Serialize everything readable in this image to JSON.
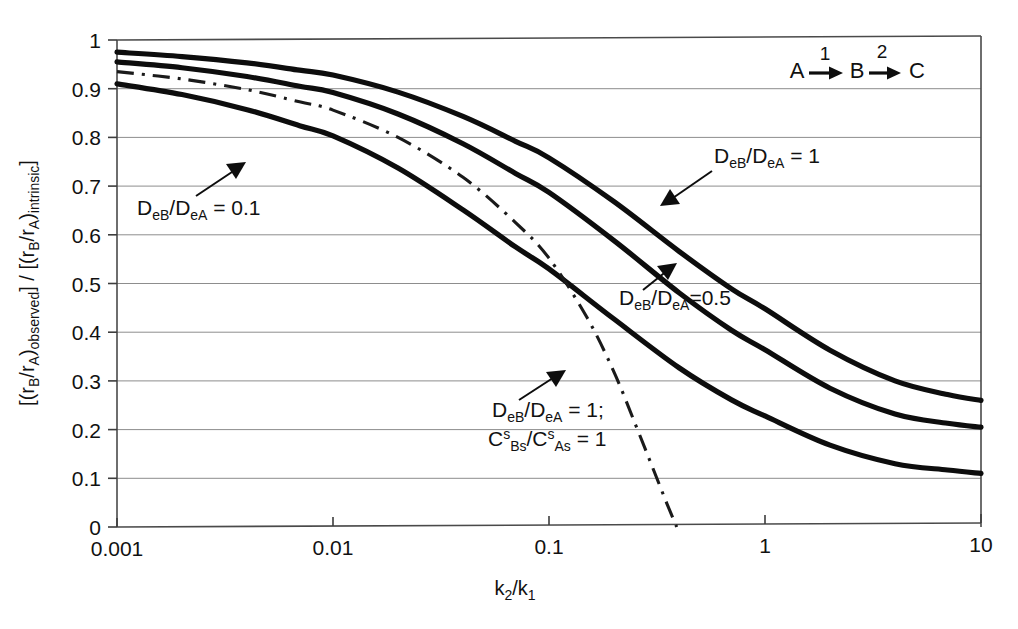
{
  "figure": {
    "background": "#ffffff",
    "curve_color": "#0d0d0d",
    "grid_color": "#8d8d8d",
    "frame_color": "#4a4a4a"
  },
  "reaction_scheme": {
    "species_a": "A",
    "step1": "1",
    "species_b": "B",
    "step2": "2",
    "species_c": "C"
  },
  "axis": {
    "y_title_part1": "[(r",
    "y_title_sub_b": "B",
    "y_title_slash": "/r",
    "y_title_sub_a": "A",
    "y_title_part2": ")",
    "y_title_observed": "observed",
    "y_title_bracket": "] / [(r",
    "y_title_intrinsic": "intrinsic",
    "y_title_close": "]",
    "x_title_k": "k",
    "x_title_sub2": "2",
    "x_title_slash": "/k",
    "x_title_sub1": "1"
  },
  "annotations": {
    "label_01": "D_eB/D_eA = 0.1",
    "label_05": "D_eB/D_eA=0.5",
    "label_1": "D_eB/D_eA = 1",
    "label_dashdot_line1": "D_eB/D_eA = 1;",
    "label_dashdot_line2": "C^s_Bs/C^s_As = 1"
  },
  "chart_data": {
    "type": "line",
    "title": "",
    "xlabel": "k2/k1",
    "ylabel": "[(rB/rA)observed] / [(rB/rA)intrinsic]",
    "xscale": "log",
    "xlim": [
      0.001,
      10
    ],
    "ylim": [
      0,
      1
    ],
    "xticks": [
      0.001,
      0.01,
      0.1,
      1,
      10
    ],
    "xtick_labels": [
      "0.001",
      "0.01",
      "0.1",
      "1",
      "10"
    ],
    "yticks": [
      0,
      0.1,
      0.2,
      0.3,
      0.4,
      0.5,
      0.6,
      0.7,
      0.8,
      0.9,
      1
    ],
    "ytick_labels": [
      "0",
      "0.1",
      "0.2",
      "0.3",
      "0.4",
      "0.5",
      "0.6",
      "0.7",
      "0.8",
      "0.9",
      "1"
    ],
    "grid": "horizontal",
    "legend": "inline-annotations",
    "series": [
      {
        "name": "DeB/DeA = 1",
        "style": "solid",
        "label_text": "DeB/DeA = 1",
        "x": [
          0.001,
          0.002,
          0.004,
          0.007,
          0.01,
          0.02,
          0.04,
          0.07,
          0.1,
          0.2,
          0.4,
          0.7,
          1,
          2,
          4,
          7,
          10
        ],
        "y": [
          0.975,
          0.966,
          0.953,
          0.938,
          0.928,
          0.893,
          0.843,
          0.792,
          0.758,
          0.668,
          0.566,
          0.489,
          0.448,
          0.363,
          0.3,
          0.272,
          0.26
        ]
      },
      {
        "name": "DeB/DeA = 0.5",
        "style": "solid",
        "label_text": "DeB/DeA=0.5",
        "x": [
          0.001,
          0.002,
          0.004,
          0.007,
          0.01,
          0.02,
          0.04,
          0.07,
          0.1,
          0.2,
          0.4,
          0.7,
          1,
          2,
          4,
          7,
          10
        ],
        "y": [
          0.955,
          0.943,
          0.925,
          0.905,
          0.892,
          0.848,
          0.787,
          0.726,
          0.687,
          0.588,
          0.481,
          0.404,
          0.364,
          0.285,
          0.232,
          0.213,
          0.205
        ]
      },
      {
        "name": "DeB/DeA = 0.1",
        "style": "solid",
        "label_text": "DeB/DeA = 0.1",
        "x": [
          0.001,
          0.002,
          0.004,
          0.007,
          0.01,
          0.02,
          0.04,
          0.07,
          0.1,
          0.2,
          0.4,
          0.7,
          1,
          2,
          4,
          7,
          10
        ],
        "y": [
          0.91,
          0.888,
          0.857,
          0.824,
          0.803,
          0.737,
          0.651,
          0.575,
          0.53,
          0.427,
          0.327,
          0.261,
          0.228,
          0.168,
          0.13,
          0.117,
          0.11
        ]
      },
      {
        "name": "DeB/DeA = 1; CsBs/CsAs = 1",
        "style": "dash-dot",
        "label_text": "DeB/DeA = 1; CsBs/CsAs = 1",
        "x": [
          0.001,
          0.002,
          0.004,
          0.007,
          0.01,
          0.02,
          0.04,
          0.07,
          0.1,
          0.15,
          0.2,
          0.25,
          0.3,
          0.35,
          0.39
        ],
        "y": [
          0.935,
          0.92,
          0.898,
          0.873,
          0.856,
          0.8,
          0.718,
          0.625,
          0.552,
          0.43,
          0.318,
          0.213,
          0.125,
          0.05,
          0.0
        ]
      }
    ]
  }
}
